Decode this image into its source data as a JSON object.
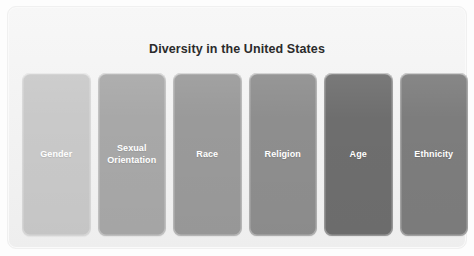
{
  "panel": {
    "title": "Diversity in the United States",
    "background_color": "#f3f3f3",
    "title_color": "#2b2b2b"
  },
  "cards": [
    {
      "label": "Gender",
      "color": "#c9c9c9",
      "text_color": "#ffffff"
    },
    {
      "label": "Sexual\nOrientation",
      "color": "#a8a8a8",
      "text_color": "#ffffff"
    },
    {
      "label": "Race",
      "color": "#9a9a9a",
      "text_color": "#ffffff"
    },
    {
      "label": "Religion",
      "color": "#8e8e8e",
      "text_color": "#ffffff"
    },
    {
      "label": "Age",
      "color": "#6e6e6e",
      "text_color": "#ffffff"
    },
    {
      "label": "Ethnicity",
      "color": "#7d7d7d",
      "text_color": "#ffffff"
    }
  ]
}
